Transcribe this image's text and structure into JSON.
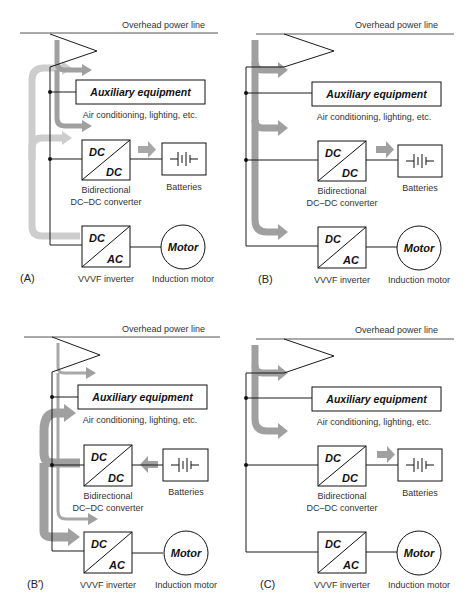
{
  "figure": {
    "panels": [
      {
        "id": "A",
        "label": "(A)",
        "mode": "regeneration-to-aux-and-battery",
        "overhead_line_label": "Overhead power line",
        "aux_title": "Auxiliary equipment",
        "aux_sub": "Air conditioning, lighting, etc.",
        "dcdc_top": "DC",
        "dcdc_bottom": "DC",
        "dcdc_caption_1": "Bidirectional",
        "dcdc_caption_2": "DC–DC converter",
        "batteries_label": "Batteries",
        "inverter_top": "DC",
        "inverter_bottom": "AC",
        "inverter_caption": "VVVF inverter",
        "motor_label": "Motor",
        "motor_caption": "Induction motor"
      },
      {
        "id": "B",
        "label": "(B)",
        "mode": "line-power-to-all",
        "overhead_line_label": "Overhead power line",
        "aux_title": "Auxiliary equipment",
        "aux_sub": "Air conditioning, lighting, etc.",
        "dcdc_top": "DC",
        "dcdc_bottom": "DC",
        "dcdc_caption_1": "Bidirectional",
        "dcdc_caption_2": "DC–DC converter",
        "batteries_label": "Batteries",
        "inverter_top": "DC",
        "inverter_bottom": "AC",
        "inverter_caption": "VVVF inverter",
        "motor_label": "Motor",
        "motor_caption": "Induction motor"
      },
      {
        "id": "B-prime",
        "label": "(B′)",
        "mode": "battery-assist",
        "overhead_line_label": "Overhead power line",
        "aux_title": "Auxiliary equipment",
        "aux_sub": "Air conditioning, lighting, etc.",
        "dcdc_top": "DC",
        "dcdc_bottom": "DC",
        "dcdc_caption_1": "Bidirectional",
        "dcdc_caption_2": "DC–DC converter",
        "batteries_label": "Batteries",
        "inverter_top": "DC",
        "inverter_bottom": "AC",
        "inverter_caption": "VVVF inverter",
        "motor_label": "Motor",
        "motor_caption": "Induction motor"
      },
      {
        "id": "C",
        "label": "(C)",
        "mode": "stopped-charging",
        "overhead_line_label": "Overhead power line",
        "aux_title": "Auxiliary equipment",
        "aux_sub": "Air conditioning, lighting, etc.",
        "dcdc_top": "DC",
        "dcdc_bottom": "DC",
        "dcdc_caption_1": "Bidirectional",
        "dcdc_caption_2": "DC–DC converter",
        "batteries_label": "Batteries",
        "inverter_top": "DC",
        "inverter_bottom": "AC",
        "inverter_caption": "VVVF inverter",
        "motor_label": "Motor",
        "motor_caption": "Induction motor"
      }
    ],
    "colors": {
      "line": "#1a1a1a",
      "text": "#222222",
      "flow_dark": "#9a9a9a",
      "flow_light": "#c8c8c8",
      "background": "#ffffff"
    }
  }
}
